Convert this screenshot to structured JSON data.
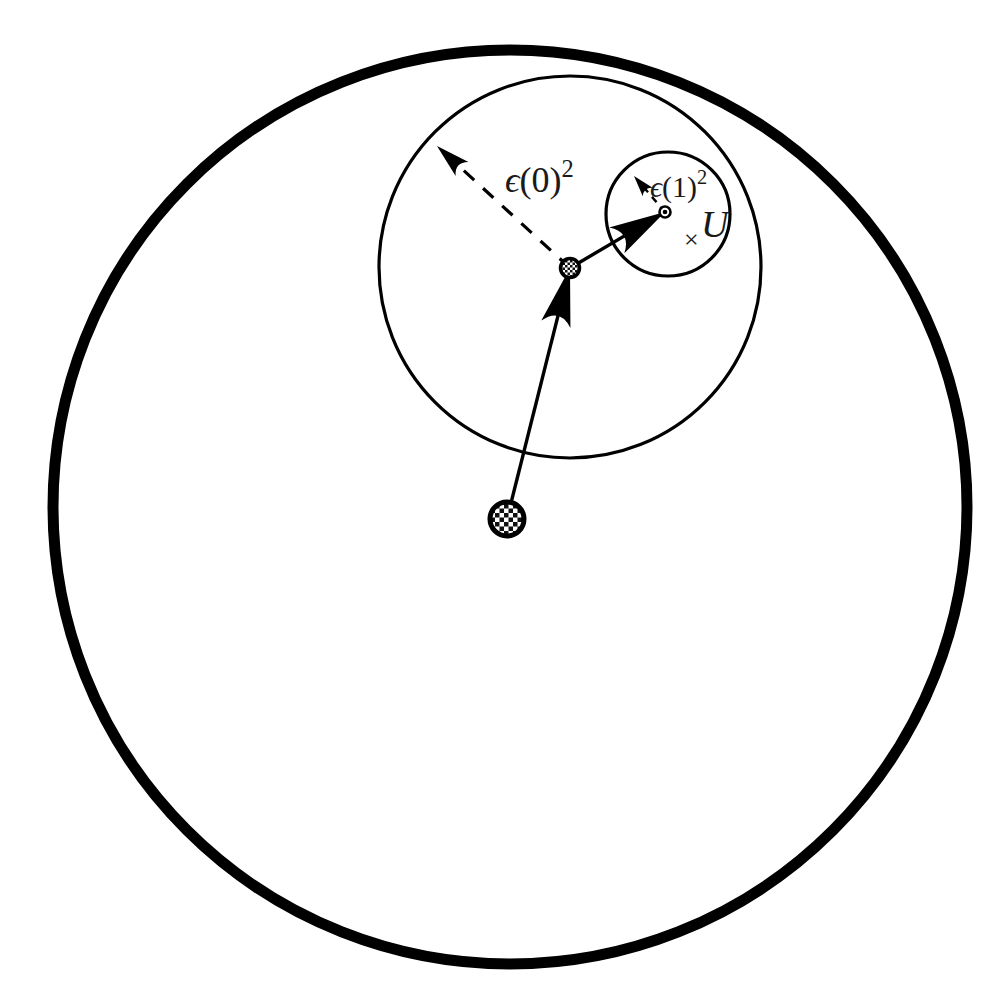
{
  "figure": {
    "background_color": "#ffffff",
    "ink_color": "#000000",
    "width": 1006,
    "height": 1007
  },
  "labels": {
    "epsilon0": {
      "text": "ϵ(0)²",
      "epsilon_glyph": "ϵ",
      "open_paren": "(",
      "index": "0",
      "close_paren": ")",
      "exponent": "2",
      "x": 505,
      "y": 192,
      "font_size": 36
    },
    "epsilon1": {
      "text": "ϵ(1)²",
      "epsilon_glyph": "ϵ",
      "open_paren": "(",
      "index": "1",
      "close_paren": ")",
      "exponent": "2",
      "x": 650,
      "y": 197,
      "font_size": 30
    },
    "target_set": {
      "text": "U",
      "x": 701,
      "y": 237,
      "font_size": 38
    },
    "target_point": {
      "text": "×",
      "x": 684,
      "y": 248,
      "font_size": 26
    }
  },
  "shapes": {
    "outer_circle": {
      "name": "outer-boundary-circle",
      "cx": 510,
      "cy": 507,
      "r": 457,
      "stroke_width": 11,
      "stroke": "#000000",
      "fill": "none"
    },
    "middle_circle": {
      "name": "epsilon-0-ball",
      "cx": 570,
      "cy": 267,
      "r": 191,
      "stroke_width": 3.2,
      "stroke": "#000000",
      "fill": "none"
    },
    "inner_circle": {
      "name": "epsilon-1-ball",
      "cx": 668,
      "cy": 214,
      "r": 62,
      "stroke_width": 3.2,
      "stroke": "#000000",
      "fill": "none"
    }
  },
  "nodes": {
    "start_node": {
      "name": "start-point-node",
      "cx": 507,
      "cy": 519,
      "r": 17,
      "fill_pattern": "checkerboard",
      "stroke_width": 5
    },
    "middle_node": {
      "name": "intermediate-point-node",
      "cx": 570,
      "cy": 268,
      "r": 9.5,
      "fill_pattern": "checkerboard",
      "stroke_width": 3.5
    },
    "end_node": {
      "name": "destination-point-node",
      "cx": 665,
      "cy": 212,
      "r": 5.5,
      "fill_pattern": "solid-dot",
      "stroke_width": 2.6
    }
  },
  "arrows": {
    "step0": {
      "name": "step-0-arrow",
      "style": "solid",
      "x1": 507,
      "y1": 519,
      "x2": 570,
      "y2": 268,
      "stroke_width": 3.4,
      "head_length": 58,
      "head_width": 30
    },
    "step1": {
      "name": "step-1-arrow",
      "style": "solid",
      "x1": 570,
      "y1": 268,
      "x2": 665,
      "y2": 212,
      "stroke_width": 3.4,
      "head_length": 56,
      "head_width": 30
    },
    "radius0": {
      "name": "epsilon-0-radius-arrow",
      "style": "dashed",
      "x1": 570,
      "y1": 268,
      "x2": 437,
      "y2": 146,
      "stroke_width": 3.2,
      "dash": "14 12",
      "head_length": 34,
      "head_width": 19
    },
    "radius1": {
      "name": "epsilon-1-radius-arrow",
      "style": "dashed",
      "x1": 665,
      "y1": 212,
      "x2": 634,
      "y2": 176,
      "stroke_width": 2.4,
      "dash": "7 6",
      "head_length": 21,
      "head_width": 13
    }
  }
}
